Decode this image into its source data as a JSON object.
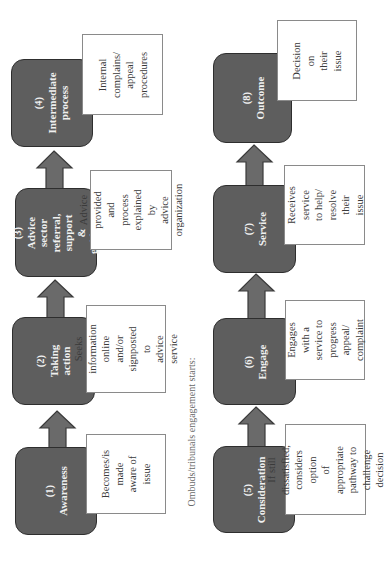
{
  "diagram": {
    "orientation": "rotated-90-ccw",
    "colors": {
      "step_fill": "#5e5e5e",
      "step_border": "#2e2e2e",
      "step_text": "#f0f0f0",
      "label_border": "#8a8a8a",
      "label_text": "#3a3a3a",
      "arrow_fill": "#6a6a6a",
      "arrow_stroke": "#3a3a3a",
      "caption_text": "#6a6a6a"
    },
    "caption": "Ombuds/tribunals engagement starts:",
    "steps": [
      {
        "num": "(1)",
        "title": "Awareness",
        "description": "Becomes/is\nmade aware of\nissue"
      },
      {
        "num": "(2)",
        "title": "Taking action",
        "description": "Seeks\ninformation\nonline and/or\nsignposted to\nadvice service"
      },
      {
        "num": "(3)",
        "title": "Advice\nsector referral,\nsupport &\nguidance",
        "description": "Advice\nprovided and\nprocess\nexplained by\nadvice\norganization"
      },
      {
        "num": "(4)",
        "title": "Intermediate\nprocess",
        "description": "Internal\ncomplains/\nappeal\nprocedures"
      },
      {
        "num": "(5)",
        "title": "Consideration",
        "description": "If still dissatisfied,\nconsiders option\nof appropriate\npathway to\nchallenge decision"
      },
      {
        "num": "(6)",
        "title": "Engage",
        "description": "Engages with a\nservice to\nprogress appeal/\ncomplaint"
      },
      {
        "num": "(7)",
        "title": "Service",
        "description": "Receives\nservice to help/\nresolve their\nissue"
      },
      {
        "num": "(8)",
        "title": "Outcome",
        "description": "Decision on\ntheir issue"
      }
    ],
    "flow": [
      [
        "(1)",
        "(2)"
      ],
      [
        "(2)",
        "(3)"
      ],
      [
        "(3)",
        "(4)"
      ],
      [
        "(5)",
        "(6)"
      ],
      [
        "(6)",
        "(7)"
      ],
      [
        "(7)",
        "(8)"
      ]
    ]
  }
}
